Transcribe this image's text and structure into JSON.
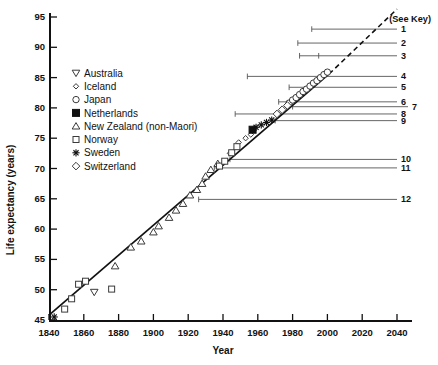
{
  "figure": {
    "see_key_label": "(See Key)"
  },
  "chart_data": {
    "type": "scatter",
    "title": "",
    "xlabel": "Year",
    "ylabel": "Life expectancy (years)",
    "xlim": [
      1840,
      2040
    ],
    "ylim": [
      45,
      95
    ],
    "x_ticks": [
      1840,
      1860,
      1880,
      1900,
      1920,
      1940,
      1960,
      1980,
      2000,
      2020,
      2040
    ],
    "y_ticks": [
      45,
      50,
      55,
      60,
      65,
      70,
      75,
      80,
      85,
      90,
      95
    ],
    "grid": false,
    "legend_position": "upper-left",
    "trend_line": {
      "solid": [
        [
          1840,
          45.8
        ],
        [
          2001,
          85.6
        ]
      ],
      "dashed": [
        [
          2001,
          85.6
        ],
        [
          2040,
          96.3
        ]
      ]
    },
    "series": [
      {
        "name": "Australia",
        "marker": "triangle-down",
        "points": [
          [
            1866,
            49.6
          ]
        ]
      },
      {
        "name": "Iceland",
        "marker": "diamond-small",
        "points": [
          [
            1944,
            72.5
          ],
          [
            1949,
            74.3
          ],
          [
            1953,
            75.0
          ],
          [
            1956,
            75.6
          ]
        ]
      },
      {
        "name": "Japan",
        "marker": "circle",
        "points": [
          [
            1978,
            80.8
          ],
          [
            1980,
            81.3
          ],
          [
            1982,
            81.7
          ],
          [
            1984,
            82.2
          ],
          [
            1986,
            82.7
          ],
          [
            1988,
            83.1
          ],
          [
            1990,
            83.6
          ],
          [
            1992,
            84.1
          ],
          [
            1994,
            84.5
          ],
          [
            1996,
            85.0
          ],
          [
            1998,
            85.5
          ],
          [
            2000,
            85.9
          ]
        ]
      },
      {
        "name": "Netherlands",
        "marker": "square-filled",
        "points": [
          [
            1957,
            76.4
          ]
        ]
      },
      {
        "name": "New Zealand (non-Maori)",
        "marker": "triangle-up",
        "points": [
          [
            1878,
            53.9
          ],
          [
            1887,
            57.0
          ],
          [
            1893,
            58.0
          ],
          [
            1900,
            59.5
          ],
          [
            1903,
            60.5
          ],
          [
            1909,
            61.9
          ],
          [
            1913,
            63.1
          ],
          [
            1917,
            64.2
          ],
          [
            1921,
            65.6
          ],
          [
            1925,
            66.5
          ],
          [
            1928,
            67.5
          ],
          [
            1930,
            68.7
          ],
          [
            1933,
            69.8
          ],
          [
            1937,
            70.8
          ]
        ]
      },
      {
        "name": "Norway",
        "marker": "square",
        "points": [
          [
            1849,
            46.8
          ],
          [
            1853,
            48.5
          ],
          [
            1857,
            50.9
          ],
          [
            1861,
            51.4
          ],
          [
            1876,
            50.1
          ],
          [
            1938,
            70.4
          ],
          [
            1941,
            71.2
          ],
          [
            1945,
            72.6
          ],
          [
            1948,
            73.6
          ]
        ]
      },
      {
        "name": "Sweden",
        "marker": "asterisk",
        "points": [
          [
            1843,
            45.5
          ],
          [
            1959,
            76.8
          ],
          [
            1962,
            77.2
          ],
          [
            1965,
            77.6
          ],
          [
            1968,
            78.0
          ]
        ]
      },
      {
        "name": "Switzerland",
        "marker": "diamond",
        "points": [
          [
            1971,
            79.0
          ],
          [
            1974,
            79.7
          ],
          [
            1977,
            80.4
          ]
        ]
      }
    ],
    "key_lines": [
      {
        "label": "1",
        "year": 1991,
        "value": 93.0
      },
      {
        "label": "2",
        "year": 1983,
        "value": 90.7
      },
      {
        "label": "3",
        "year": 1984,
        "value": 88.6,
        "extra_tick_year": 1995
      },
      {
        "label": "4",
        "year": 1954,
        "value": 85.2
      },
      {
        "label": "5",
        "year": 1978,
        "value": 83.4
      },
      {
        "label": "6",
        "year": 1972,
        "value": 81.0
      },
      {
        "label": "7",
        "year": 1980,
        "value": 80.2,
        "extended": true
      },
      {
        "label": "8",
        "year": 1947,
        "value": 79.0
      },
      {
        "label": "9",
        "year": 1970,
        "value": 77.9
      },
      {
        "label": "10",
        "year": 1944,
        "value": 71.5
      },
      {
        "label": "11",
        "year": 1935,
        "value": 70.1
      },
      {
        "label": "12",
        "year": 1926,
        "value": 64.9
      }
    ]
  }
}
